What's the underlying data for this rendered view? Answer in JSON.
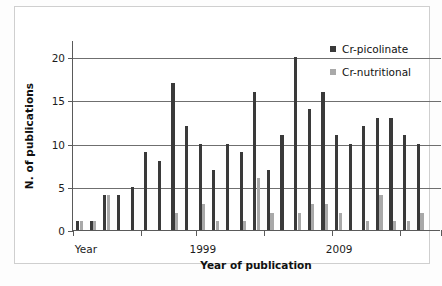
{
  "figure": {
    "background": "#ffffff",
    "border_color": "#cfcfcf"
  },
  "chart_data": {
    "type": "bar",
    "title": "",
    "xlabel": "Year of publication",
    "ylabel": "N. of  publications",
    "ylim": [
      0,
      22
    ],
    "yticks": [
      0,
      5,
      10,
      15,
      20
    ],
    "grid": true,
    "legend_position": "top-right",
    "xtick_labels": [
      "Year",
      "1999",
      "2009"
    ],
    "categories": [
      "1990",
      "1991",
      "1992",
      "1993",
      "1994",
      "1995",
      "1996",
      "1997",
      "1998",
      "1999",
      "2000",
      "2001",
      "2002",
      "2003",
      "2004",
      "2005",
      "2006",
      "2007",
      "2008",
      "2009",
      "2010",
      "2011",
      "2012",
      "2013",
      "2014",
      "2015",
      "2016"
    ],
    "series": [
      {
        "name": "Cr-picolinate",
        "color": "#3a3a3a",
        "values": [
          1,
          1,
          4,
          4,
          5,
          9,
          8,
          17,
          12,
          10,
          7,
          10,
          9,
          16,
          7,
          11,
          20,
          14,
          16,
          11,
          10,
          12,
          13,
          13,
          11,
          10,
          0
        ]
      },
      {
        "name": "Cr-nutritional",
        "color": "#a9a9a9",
        "values": [
          1,
          1,
          4,
          0,
          0,
          0,
          0,
          2,
          0,
          3,
          1,
          0,
          1,
          6,
          2,
          0,
          2,
          3,
          3,
          2,
          0,
          1,
          4,
          1,
          1,
          2,
          0
        ]
      }
    ]
  },
  "legend": {
    "items": [
      {
        "label": "Cr-picolinate",
        "color": "#3a3a3a"
      },
      {
        "label": "Cr-nutritional",
        "color": "#a9a9a9"
      }
    ]
  },
  "axis": {
    "y_title": "N. of  publications",
    "x_title": "Year of publication",
    "y_tick_labels": [
      "0",
      "5",
      "10",
      "15",
      "20"
    ],
    "x_tick_labels": [
      "Year",
      "1999",
      "2009"
    ]
  }
}
